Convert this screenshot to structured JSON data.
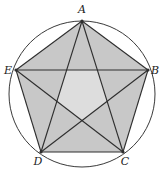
{
  "diagram": {
    "type": "pentagram-in-circle",
    "circle": {
      "cx": 82,
      "cy": 94,
      "r": 73,
      "stroke": "#3a3a3a"
    },
    "colors": {
      "outer_fill": "#c8c8c8",
      "inner_fill": "#dddddd",
      "line": "#2e2e2e",
      "label": "#222222"
    },
    "vertices": [
      {
        "name": "A",
        "x": 82,
        "y": 21,
        "label_x": 82,
        "label_y": 13
      },
      {
        "name": "B",
        "x": 148,
        "y": 70,
        "label_x": 155,
        "label_y": 74
      },
      {
        "name": "C",
        "x": 123,
        "y": 152,
        "label_x": 125,
        "label_y": 165
      },
      {
        "name": "D",
        "x": 41,
        "y": 152,
        "label_x": 38,
        "label_y": 165
      },
      {
        "name": "E",
        "x": 16,
        "y": 70,
        "label_x": 8,
        "label_y": 74
      }
    ],
    "edges": [
      "AB",
      "BC",
      "CD",
      "DE",
      "EA"
    ],
    "diagonals": [
      "AC",
      "AD",
      "BD",
      "BE",
      "CE"
    ]
  }
}
